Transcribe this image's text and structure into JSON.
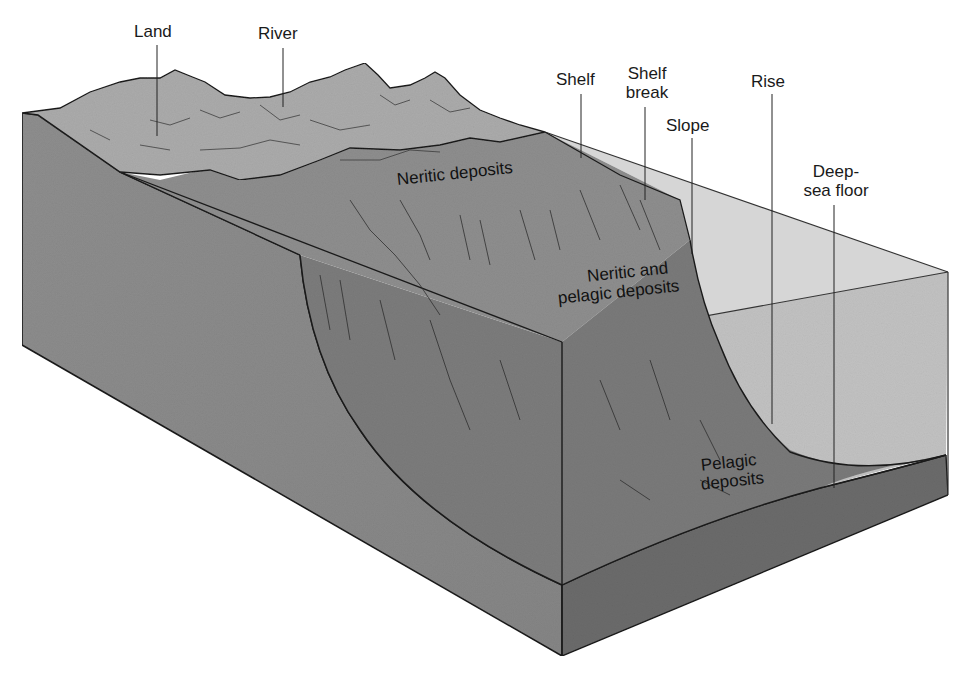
{
  "diagram": {
    "colors": {
      "background": "#ffffff",
      "land": "#a9a9a9",
      "shelf_surface": "#8f8f8f",
      "front_left_face": "#8a8a8a",
      "slope_surface": "#7a7a7a",
      "water_box": "#c4c4c4",
      "water_top": "#d0d0d0",
      "sediment_front": "#8d8d8d",
      "sediment_right": "#6a6a6a",
      "outline": "#1a1a1a"
    },
    "callout_labels": {
      "land": "Land",
      "river": "River",
      "shelf": "Shelf",
      "shelf_break_line1": "Shelf",
      "shelf_break_line2": "break",
      "slope": "Slope",
      "rise": "Rise",
      "deep_sea_floor_line1": "Deep-",
      "deep_sea_floor_line2": "sea floor"
    },
    "region_labels": {
      "neritic_deposits": "Neritic deposits",
      "neritic_pelagic_line1": "Neritic and",
      "neritic_pelagic_line2": "pelagic deposits",
      "pelagic_line1": "Pelagic",
      "pelagic_line2": "deposits"
    }
  }
}
